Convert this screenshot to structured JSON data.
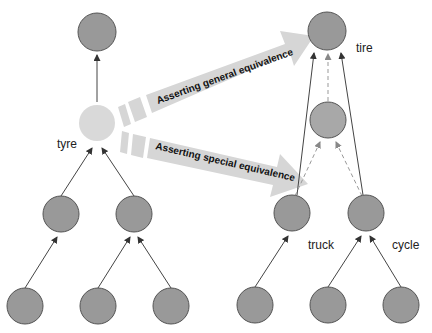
{
  "labels": {
    "tyre": "tyre",
    "tire": "tire",
    "truck": "truck",
    "cycle": "cycle"
  },
  "arrows": {
    "general": "Asserting general equivalence",
    "special": "Asserting special equivalence"
  },
  "colors": {
    "node_fill": "#999999",
    "node_stroke": "#555555",
    "highlight_node_fill": "#d9d9d9",
    "middle_node_fill": "#a8a8a8",
    "big_arrow_fill": "#d6d6d6",
    "edge": "#444444",
    "dashed_edge": "#999999"
  }
}
